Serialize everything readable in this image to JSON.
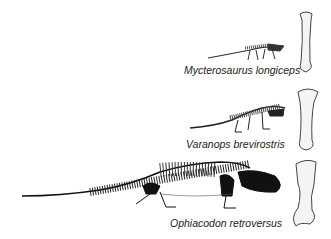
{
  "figure": {
    "specimens": [
      {
        "name": "Mycterosaurus longiceps",
        "row": 1
      },
      {
        "name": "Varanops brevirostris",
        "row": 2
      },
      {
        "name": "Ophiacodon retroversus",
        "row": 3
      }
    ]
  }
}
